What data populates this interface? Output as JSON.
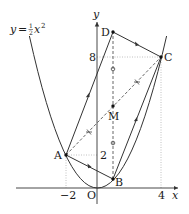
{
  "figure": {
    "equation_label": {
      "lhs": "y",
      "eq": "=",
      "num": "1",
      "den": "2",
      "var": "x",
      "exp": "2"
    },
    "axes": {
      "x_label": "x",
      "y_label": "y",
      "origin_label": "O",
      "x_ticks": [
        {
          "value": -2,
          "label": "−2"
        },
        {
          "value": 4,
          "label": "4"
        }
      ],
      "y_ticks": [
        {
          "value": 2,
          "label": "2"
        },
        {
          "value": 8,
          "label": "8"
        }
      ]
    },
    "curve": {
      "equation": "y = 1/2 x^2",
      "color": "#333333"
    },
    "points": [
      {
        "name": "A",
        "x": -2,
        "y": 2
      },
      {
        "name": "B",
        "x": 1,
        "y": 0.5
      },
      {
        "name": "C",
        "x": 4,
        "y": 8
      },
      {
        "name": "D",
        "x": 1,
        "y": 9.5
      },
      {
        "name": "M",
        "x": 1,
        "y": 5
      }
    ],
    "segments": [
      {
        "from": "A",
        "to": "B",
        "style": "solid",
        "mark": "arrow"
      },
      {
        "from": "D",
        "to": "C",
        "style": "solid",
        "mark": "arrow"
      },
      {
        "from": "A",
        "to": "D",
        "style": "solid",
        "mark": "arrow"
      },
      {
        "from": "B",
        "to": "C",
        "style": "solid",
        "mark": "arrow"
      },
      {
        "from": "A",
        "to": "C",
        "style": "dashed",
        "mark": "double-tick"
      },
      {
        "from": "B",
        "to": "D",
        "style": "dashed",
        "mark": "circle"
      }
    ],
    "colors": {
      "line": "#333333",
      "guide": "#9a9a9a",
      "dashed": "#555555"
    }
  }
}
